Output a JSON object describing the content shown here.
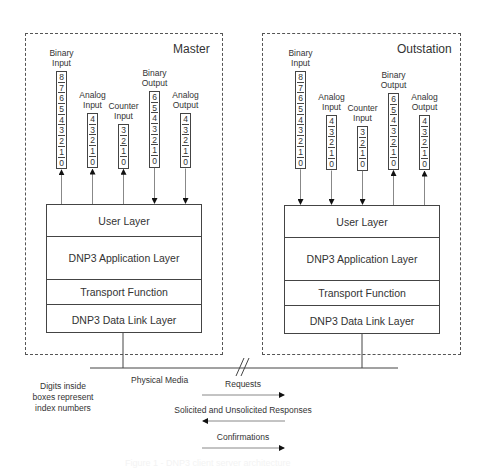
{
  "diagram": {
    "stations": [
      {
        "id": "master",
        "title": "Master",
        "box": {
          "x": 25,
          "y": 33,
          "w": 198,
          "h": 322
        },
        "stack": {
          "x": 46,
          "y": 204,
          "w": 156,
          "h": 129
        },
        "connector_x": 123,
        "columns": [
          {
            "label_line1": "Binary",
            "label_line2": "Input",
            "x": 56,
            "top": 71,
            "indices": [
              "8",
              "7",
              "6",
              "5",
              "4",
              "3",
              "2",
              "1",
              "0"
            ],
            "arrow": "up"
          },
          {
            "label_line1": "Analog",
            "label_line2": "Input",
            "x": 87,
            "top": 113,
            "indices": [
              "4",
              "3",
              "2",
              "1",
              "0"
            ],
            "arrow": "up"
          },
          {
            "label_line1": "Counter",
            "label_line2": "Input",
            "x": 118,
            "top": 124,
            "indices": [
              "3",
              "2",
              "1",
              "0"
            ],
            "arrow": "up"
          },
          {
            "label_line1": "Binary",
            "label_line2": "Output",
            "x": 149,
            "top": 91,
            "indices": [
              "6",
              "5",
              "4",
              "3",
              "2",
              "1",
              "0"
            ],
            "arrow": "down"
          },
          {
            "label_line1": "Analog",
            "label_line2": "Output",
            "x": 180,
            "top": 113,
            "indices": [
              "4",
              "3",
              "2",
              "1",
              "0"
            ],
            "arrow": "down"
          }
        ],
        "layers": [
          {
            "label": "User Layer",
            "height": 32
          },
          {
            "label": "DNP3 Application Layer",
            "height": 43
          },
          {
            "label": "Transport Function",
            "height": 25
          },
          {
            "label": "DNP3 Data Link Layer",
            "height": 29
          }
        ]
      },
      {
        "id": "outstation",
        "title": "Outstation",
        "box": {
          "x": 262,
          "y": 33,
          "w": 199,
          "h": 322
        },
        "stack": {
          "x": 284,
          "y": 205,
          "w": 156,
          "h": 129
        },
        "connector_x": 362,
        "columns": [
          {
            "label_line1": "Binary",
            "label_line2": "Input",
            "x": 295,
            "top": 71,
            "indices": [
              "8",
              "7",
              "6",
              "5",
              "4",
              "3",
              "2",
              "1",
              "0"
            ],
            "arrow": "down"
          },
          {
            "label_line1": "Analog",
            "label_line2": "Input",
            "x": 326,
            "top": 115,
            "indices": [
              "4",
              "3",
              "2",
              "1",
              "0"
            ],
            "arrow": "down"
          },
          {
            "label_line1": "Counter",
            "label_line2": "Input",
            "x": 357,
            "top": 126,
            "indices": [
              "3",
              "2",
              "1",
              "0"
            ],
            "arrow": "down"
          },
          {
            "label_line1": "Binary",
            "label_line2": "Output",
            "x": 388,
            "top": 93,
            "indices": [
              "6",
              "5",
              "4",
              "3",
              "2",
              "1",
              "0"
            ],
            "arrow": "up"
          },
          {
            "label_line1": "Analog",
            "label_line2": "Output",
            "x": 419,
            "top": 115,
            "indices": [
              "4",
              "3",
              "2",
              "1",
              "0"
            ],
            "arrow": "up"
          }
        ],
        "layers": [
          {
            "label": "User Layer",
            "height": 32
          },
          {
            "label": "DNP3 Application Layer",
            "height": 43
          },
          {
            "label": "Transport Function",
            "height": 25
          },
          {
            "label": "DNP3 Data Link Layer",
            "height": 29
          }
        ]
      }
    ],
    "physical_media": {
      "label": "Physical Media",
      "y": 368,
      "x1": 90,
      "x2": 398
    },
    "note": {
      "line1": "Digits inside",
      "line2": "boxes represent",
      "line3": "index numbers"
    },
    "messages": [
      {
        "label": "Requests",
        "direction": "right",
        "y": 395
      },
      {
        "label": "Solicited and Unsolicited Responses",
        "direction": "left",
        "y": 421
      },
      {
        "label": "Confirmations",
        "direction": "right",
        "y": 448
      }
    ],
    "caption": "Figure 1 - DNP3 client server architecture"
  }
}
